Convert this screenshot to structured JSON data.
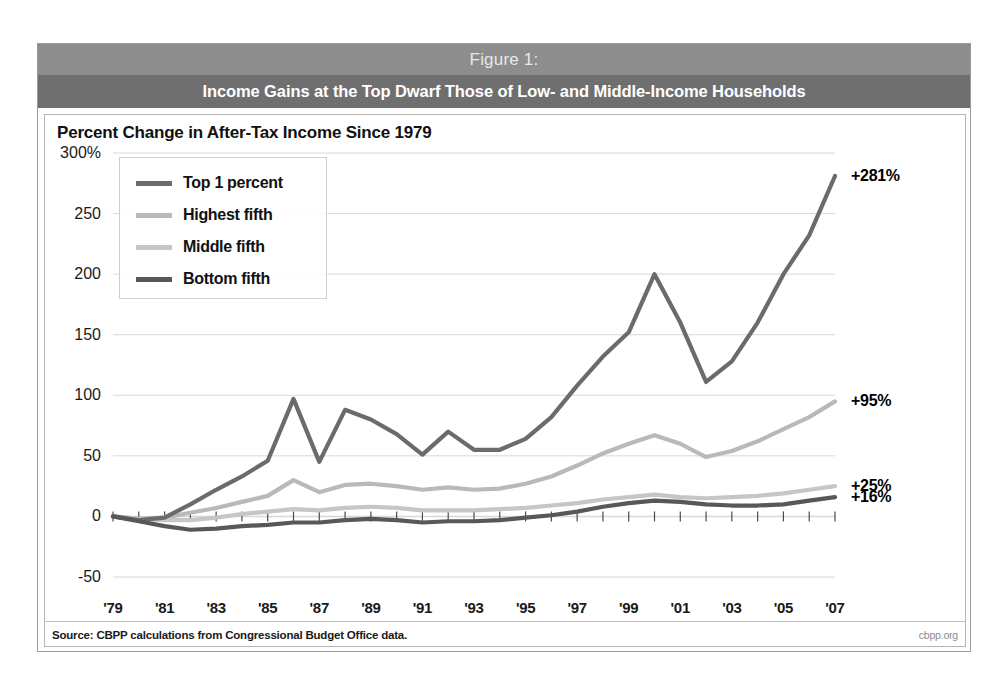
{
  "figure": {
    "number_label": "Figure 1:",
    "headline": "Income Gains at the Top Dwarf Those of Low- and Middle-Income Households",
    "subtitle": "Percent Change in After-Tax Income Since 1979",
    "source": "Source: CBPP calculations from Congressional Budget Office data.",
    "watermark": "cbpp.org"
  },
  "chart_data": {
    "type": "line",
    "title": "Income Gains at the Top Dwarf Those of Low- and Middle-Income Households",
    "subtitle": "Percent Change in After-Tax Income Since 1979",
    "xlabel": "",
    "ylabel": "Percent Change in After-Tax Income Since 1979",
    "ylim": [
      -50,
      300
    ],
    "xlim": [
      1979,
      2007
    ],
    "grid": true,
    "legend_position": "upper-left",
    "yticks": [
      300,
      250,
      200,
      150,
      100,
      50,
      0,
      -50
    ],
    "ytick_labels": [
      "300%",
      "250",
      "200",
      "150",
      "100",
      "50",
      "0",
      "-50"
    ],
    "xticks": [
      1979,
      1981,
      1983,
      1985,
      1987,
      1989,
      1991,
      1993,
      1995,
      1997,
      1999,
      2001,
      2003,
      2005,
      2007
    ],
    "xtick_labels": [
      "'79",
      "'81",
      "'83",
      "'85",
      "'87",
      "'89",
      "'91",
      "'93",
      "'95",
      "'97",
      "'99",
      "'01",
      "'03",
      "'05",
      "'07"
    ],
    "x": [
      1979,
      1980,
      1981,
      1982,
      1983,
      1984,
      1985,
      1986,
      1987,
      1988,
      1989,
      1990,
      1991,
      1992,
      1993,
      1994,
      1995,
      1996,
      1997,
      1998,
      1999,
      2000,
      2001,
      2002,
      2003,
      2004,
      2005,
      2006,
      2007
    ],
    "series": [
      {
        "name": "Top 1 percent",
        "color": "#6b6b6b",
        "end_label": "+281%",
        "end_value": 281,
        "values": [
          0,
          -3,
          -1,
          10,
          22,
          33,
          46,
          97,
          45,
          88,
          80,
          68,
          51,
          70,
          55,
          55,
          64,
          82,
          108,
          132,
          152,
          200,
          160,
          111,
          128,
          160,
          200,
          232,
          281
        ]
      },
      {
        "name": "Highest fifth",
        "color": "#b9b9b9",
        "end_label": "+95%",
        "end_value": 95,
        "values": [
          0,
          -2,
          -1,
          3,
          7,
          12,
          17,
          30,
          20,
          26,
          27,
          25,
          22,
          24,
          22,
          23,
          27,
          33,
          42,
          52,
          60,
          67,
          60,
          49,
          54,
          62,
          72,
          82,
          95
        ]
      },
      {
        "name": "Middle fifth",
        "color": "#c6c6c6",
        "end_label": "+25%",
        "end_value": 25,
        "values": [
          0,
          -2,
          -3,
          -3,
          -1,
          2,
          4,
          6,
          5,
          7,
          8,
          7,
          5,
          5,
          5,
          6,
          7,
          9,
          11,
          14,
          16,
          18,
          16,
          15,
          16,
          17,
          19,
          22,
          25
        ]
      },
      {
        "name": "Bottom fifth",
        "color": "#585858",
        "end_label": "+16%",
        "end_value": 16,
        "values": [
          0,
          -4,
          -8,
          -11,
          -10,
          -8,
          -7,
          -5,
          -5,
          -3,
          -2,
          -3,
          -5,
          -4,
          -4,
          -3,
          -1,
          1,
          4,
          8,
          11,
          13,
          12,
          10,
          9,
          9,
          10,
          13,
          16
        ]
      }
    ]
  },
  "colors": {
    "header_top_band": "#8d8d8d",
    "header_bottom_band": "#6f6f6f",
    "frame_border": "#9a9a9a",
    "grid": "#d8d8d8"
  }
}
